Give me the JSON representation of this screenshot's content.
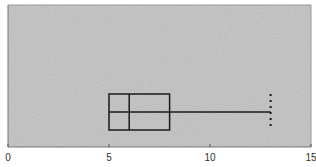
{
  "chart_data": {
    "type": "box",
    "orientation": "horizontal",
    "title": "",
    "xlabel": "",
    "ylabel": "",
    "xlim": [
      0,
      15
    ],
    "x_ticks": [
      0,
      5,
      10,
      15
    ],
    "x_tick_labels": [
      "0",
      "5",
      "10",
      "15"
    ],
    "grid": false,
    "legend": null,
    "series": [
      {
        "name": "",
        "min": 5.0,
        "q1": 5.0,
        "median": 6.0,
        "q3": 8.0,
        "max": 13.0,
        "whisker_cap_style": "dotted"
      }
    ],
    "colors": {
      "plot_background": "#c9c9c9",
      "box_stroke": "#1a1a1a",
      "axis": "#555555"
    }
  }
}
